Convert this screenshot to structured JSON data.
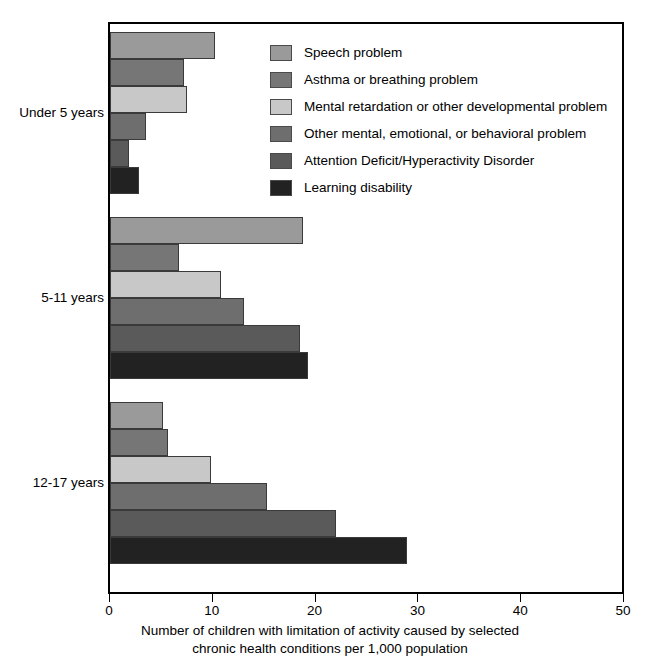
{
  "chart_data": {
    "type": "bar",
    "orientation": "horizontal",
    "title": "",
    "xlabel_line1": "Number of children with limitation of activity caused by selected",
    "xlabel_line2": "chronic health conditions per 1,000 population",
    "ylabel": "",
    "xlim": [
      0,
      50
    ],
    "xticks": [
      0,
      10,
      20,
      30,
      40,
      50
    ],
    "xtick_labels": [
      "0",
      "10",
      "20",
      "30",
      "40",
      "50"
    ],
    "grid": false,
    "legend_position": "inside-top-right",
    "categories": [
      "Under 5 years",
      "5-11 years",
      "12-17 years"
    ],
    "series": [
      {
        "name": "Speech problem",
        "color": "#9a9a9a",
        "values": [
          10.2,
          18.8,
          5.2
        ]
      },
      {
        "name": "Asthma or breathing problem",
        "color": "#767676",
        "values": [
          7.2,
          6.7,
          5.6
        ]
      },
      {
        "name": "Mental retardation or other developmental problem",
        "color": "#c8c8c8",
        "values": [
          7.5,
          10.8,
          9.8
        ]
      },
      {
        "name": "Other mental, emotional, or behavioral problem",
        "color": "#6e6e6e",
        "values": [
          3.5,
          13.0,
          15.3
        ]
      },
      {
        "name": "Attention Deficit/Hyperactivity Disorder",
        "color": "#5a5a5a",
        "values": [
          1.8,
          18.5,
          22.0
        ]
      },
      {
        "name": "Learning disability",
        "color": "#222222",
        "values": [
          2.8,
          19.3,
          28.9
        ]
      }
    ]
  },
  "legend": {
    "items": [
      {
        "label": "Speech problem",
        "color": "#9a9a9a"
      },
      {
        "label": "Asthma or breathing problem",
        "color": "#767676"
      },
      {
        "label": "Mental retardation or other developmental problem",
        "color": "#c8c8c8"
      },
      {
        "label": "Other mental, emotional, or behavioral problem",
        "color": "#6e6e6e"
      },
      {
        "label": "Attention Deficit/Hyperactivity Disorder",
        "color": "#5a5a5a"
      },
      {
        "label": "Learning disability",
        "color": "#222222"
      }
    ]
  }
}
